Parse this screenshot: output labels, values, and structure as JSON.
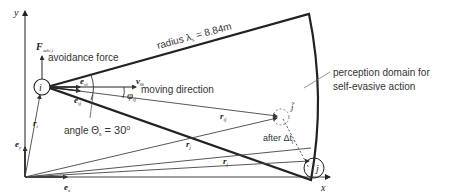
{
  "diagram": {
    "axes": {
      "x_label": "x",
      "y_label": "y",
      "ex_label": "e",
      "ex_sub": "x",
      "ey_label": "e",
      "ey_sub": "y"
    },
    "pedestrian_i": {
      "label": "i",
      "position_label": "r",
      "position_sub": "i"
    },
    "pedestrian_j": {
      "label": "j",
      "position_label": "r",
      "position_sub": "j"
    },
    "pedestrian_j_tilde": {
      "label": "j̃",
      "position_label": "r",
      "position_sub": "j̃"
    },
    "relative_vector": {
      "label": "r",
      "sub": "ij̃"
    },
    "force": {
      "symbol": "F",
      "sub": "selc,i",
      "label": "avoidance force"
    },
    "velocity": {
      "symbol": "v",
      "sub": "0i",
      "label": "moving direction"
    },
    "unit_vectors": {
      "e_vi": {
        "symbol": "e",
        "sub": "vi"
      },
      "e_ij": {
        "symbol": "e",
        "sub": "ij̃"
      }
    },
    "angle_phi": {
      "symbol": "φ",
      "sub": "ij̃"
    },
    "angle_theta": {
      "text": "angle Θ",
      "sub": "s",
      "value": " = 30",
      "unit": "o"
    },
    "radius": {
      "text": "radius λ",
      "sub": "s",
      "value": " = 8.84m"
    },
    "after_dt": {
      "text": "after Δt",
      "sub": "j"
    },
    "perception_domain": {
      "line1": "perception domain for",
      "line2": "self-evasive action"
    },
    "colors": {
      "line": "#222222",
      "thin_line": "#444444",
      "dashed": "#666666",
      "text": "#333333"
    }
  }
}
